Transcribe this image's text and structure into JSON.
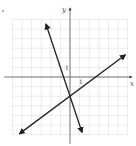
{
  "chart_data": {
    "type": "line",
    "title": "",
    "xlabel": "x",
    "ylabel": "y",
    "xlim": [
      -6,
      6
    ],
    "ylim": [
      -6,
      6
    ],
    "grid": true,
    "tick_labels": {
      "x": "1",
      "y": "1"
    },
    "series": [
      {
        "name": "steep line",
        "equation": "y = -3x - 2",
        "slope": -3,
        "intercept": -2,
        "x": [
          -2.5,
          1.25
        ],
        "y": [
          5.5,
          -5.75
        ],
        "arrows": "both"
      },
      {
        "name": "shallow line",
        "equation": "y = 0.75x - 2",
        "slope": 0.75,
        "intercept": -2,
        "x": [
          -5.25,
          5.75
        ],
        "y": [
          -5.9,
          2.3
        ],
        "arrows": "both"
      }
    ],
    "intersection": [
      0,
      -2
    ]
  },
  "labels": {
    "x_axis": "x",
    "y_axis": "y",
    "x_unit": "1",
    "y_unit": "1"
  }
}
